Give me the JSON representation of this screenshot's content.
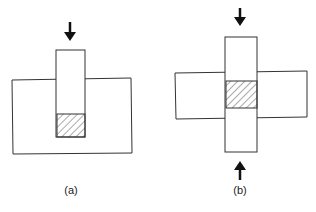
{
  "figure": {
    "panels": [
      {
        "id": "a",
        "label": "(a)",
        "description": "Single vertical bar pressed into a block from above; hatched region at bar tip inside block"
      },
      {
        "id": "b",
        "label": "(b)",
        "description": "Vertical bar crossing horizontal block, pressed from top and bottom; hatched overlap region at center"
      }
    ],
    "colors": {
      "stroke": "#333333",
      "hatch": "#444444",
      "background": "#ffffff"
    }
  }
}
